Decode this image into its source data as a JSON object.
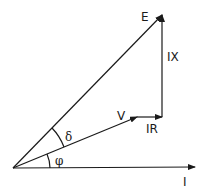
{
  "diagram": {
    "labels": {
      "E": "E",
      "IX": "IX",
      "V": "V",
      "IR": "IR",
      "I": "I",
      "delta": "δ",
      "phi": "φ"
    },
    "vectors": [
      {
        "name": "I",
        "from": [
          13,
          168
        ],
        "to": [
          195,
          167
        ]
      },
      {
        "name": "V",
        "from": [
          13,
          168
        ],
        "to": [
          137,
          117
        ]
      },
      {
        "name": "IR",
        "from": [
          137,
          117
        ],
        "to": [
          162,
          117
        ]
      },
      {
        "name": "IX",
        "from": [
          162,
          117
        ],
        "to": [
          162,
          15
        ]
      },
      {
        "name": "E",
        "from": [
          13,
          168
        ],
        "to": [
          162,
          15
        ]
      }
    ],
    "angles": [
      {
        "name": "phi",
        "between": [
          "I",
          "V"
        ]
      },
      {
        "name": "delta",
        "between": [
          "V",
          "E"
        ]
      }
    ],
    "colors": {
      "ink": "#1a1a1a",
      "background": "#ffffff"
    }
  }
}
